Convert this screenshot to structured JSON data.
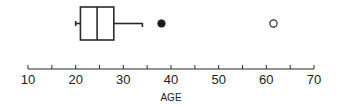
{
  "chart_data": {
    "type": "boxplot",
    "title": "",
    "xlabel": "AGE",
    "ylabel": "",
    "xlim": [
      10,
      70
    ],
    "ticks": {
      "major": [
        10,
        20,
        30,
        40,
        50,
        60,
        70
      ],
      "minor": [
        15,
        25,
        35,
        45,
        55,
        65
      ],
      "labels": [
        "10",
        "20",
        "30",
        "40",
        "50",
        "60",
        "70"
      ]
    },
    "grid": false,
    "legend": null,
    "box": {
      "whisker_low": 20,
      "q1": 21,
      "median": 24.5,
      "q3": 28,
      "whisker_high": 34
    },
    "outliers": [
      {
        "value": 38,
        "style": "filled"
      },
      {
        "value": 61.5,
        "style": "open"
      }
    ]
  },
  "colors": {
    "stroke": "#2a2a2a",
    "fill_outlier": "#1a1a1a",
    "background": "#ffffff"
  }
}
